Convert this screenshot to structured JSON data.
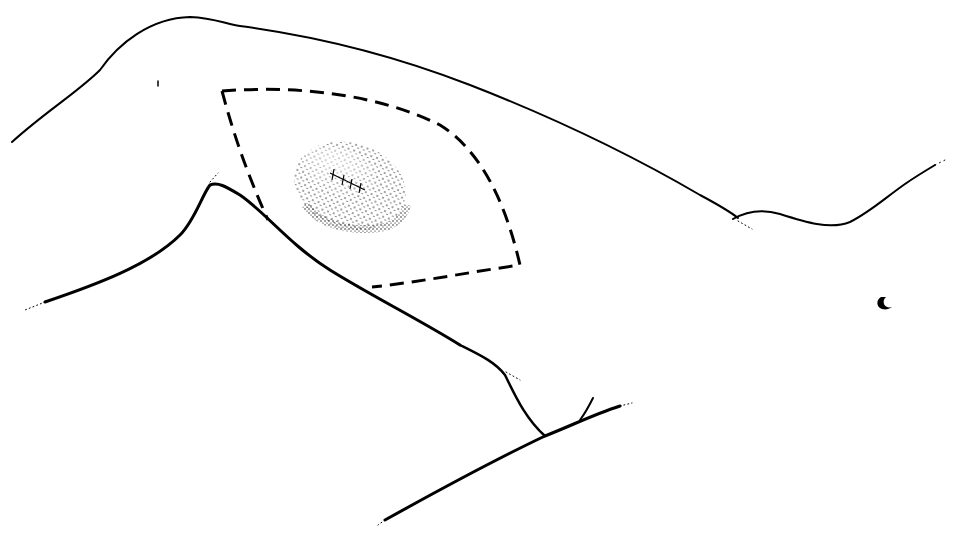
{
  "figure": {
    "type": "surgical line illustration",
    "elements": [
      {
        "id": "body-outline",
        "description": "solid contour of upper arm, axilla and lateral chest"
      },
      {
        "id": "excision-outline",
        "description": "dashed leaf/spindle-shaped incision boundary"
      },
      {
        "id": "lesion",
        "description": "stippled oval lesion with cross-stitch suture marks"
      },
      {
        "id": "nipple",
        "description": "small curved mark at right side of chest"
      }
    ],
    "colors": {
      "ink": "#000000",
      "background": "#ffffff"
    }
  }
}
